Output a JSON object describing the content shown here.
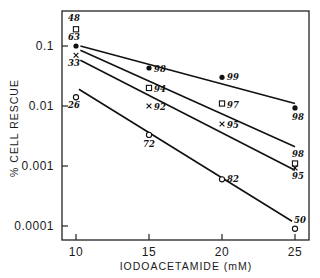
{
  "chart_data": {
    "type": "scatter",
    "title": "",
    "xlabel": "IODOACETAMIDE (mM)",
    "ylabel": "% CELL RESCUE",
    "xscale": "linear",
    "yscale": "log",
    "xlim": [
      9,
      26
    ],
    "ylim": [
      5e-05,
      0.3
    ],
    "x_ticks": [
      10,
      15,
      20,
      25
    ],
    "x_tick_labels": [
      "10",
      "15",
      "20",
      "25"
    ],
    "y_ticks": [
      0.1,
      0.01,
      0.001,
      0.0001
    ],
    "y_tick_labels": [
      "0.1",
      "0.01",
      "0.001",
      "0.0001"
    ],
    "grid": false,
    "legend": null,
    "series": [
      {
        "name": "filled-circle",
        "marker": "filled-circle",
        "x": [
          10,
          15,
          20,
          25
        ],
        "values": [
          0.1,
          0.043,
          0.03,
          0.0093
        ],
        "point_labels": [
          "63",
          "98",
          "99",
          "98"
        ],
        "fit_line": {
          "x": [
            10.3,
            25
          ],
          "y": [
            0.1,
            0.011
          ]
        }
      },
      {
        "name": "open-square",
        "marker": "open-square",
        "x": [
          10,
          15,
          20,
          25
        ],
        "values": [
          0.19,
          0.02,
          0.011,
          0.0011
        ],
        "point_labels": [
          "48",
          "94",
          "97",
          "98"
        ],
        "fit_line": {
          "x": [
            10.3,
            25
          ],
          "y": [
            0.085,
            0.0021
          ]
        }
      },
      {
        "name": "cross",
        "marker": "x",
        "x": [
          10,
          15,
          20,
          25
        ],
        "values": [
          0.07,
          0.01,
          0.005,
          0.00093
        ],
        "point_labels": [
          "33",
          "92",
          "95",
          "95"
        ],
        "fit_line": {
          "x": [
            10.3,
            25
          ],
          "y": [
            0.058,
            0.00085
          ]
        }
      },
      {
        "name": "open-circle",
        "marker": "open-circle",
        "x": [
          10,
          15,
          20,
          25
        ],
        "values": [
          0.014,
          0.0033,
          0.0006,
          9e-05
        ],
        "point_labels": [
          "26",
          "72",
          "82",
          "50"
        ],
        "fit_line": {
          "x": [
            10.2,
            24.8
          ],
          "y": [
            0.019,
            0.00012
          ]
        }
      }
    ]
  }
}
